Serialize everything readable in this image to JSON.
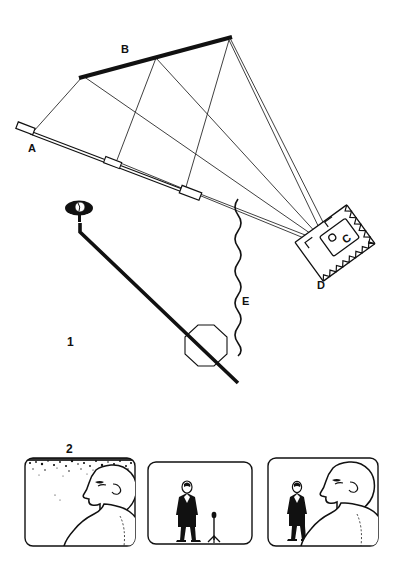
{
  "figure": {
    "type": "technical-line-diagram",
    "background_color": "#ffffff",
    "ink_color": "#111111",
    "width": 400,
    "height": 581
  },
  "figure1": {
    "number_label": "1",
    "caption_letters": {
      "a": "A",
      "b": "B",
      "c": "C",
      "d": "D",
      "e": "E"
    },
    "parts": [
      {
        "id": "A",
        "name": "lower-rail",
        "description": "thin double-line rail with end caps, inclined down-right"
      },
      {
        "id": "B",
        "name": "upper-bar",
        "description": "thick solid bar inclined up-right"
      },
      {
        "id": "C",
        "name": "lens-aperture",
        "description": "small circle and c-shape inside inner block of unit D"
      },
      {
        "id": "D",
        "name": "projector-unit",
        "description": "tilted rectangular housing with hatched border"
      },
      {
        "id": "E",
        "name": "wavy-signal-line",
        "description": "vertical wavy line"
      }
    ],
    "other_elements": [
      {
        "name": "eye-indicator",
        "description": "filled ellipse with white iris on a short post"
      },
      {
        "name": "pointer-arm",
        "description": "thick line from eye post down to lower right"
      },
      {
        "name": "octagon-target",
        "description": "outlined octagon crossed by the pointer arm"
      },
      {
        "name": "ray-lines",
        "description": "thin straight rays converging on unit D"
      }
    ]
  },
  "figure2": {
    "number_label": "2",
    "frames": [
      {
        "name": "frame-left",
        "content": "close-up profile of a person's head and shoulders with stippled/grainy background at top",
        "elements": [
          "head-profile-outline",
          "shoulder-outline",
          "stipple-texture"
        ]
      },
      {
        "name": "frame-middle",
        "content": "full-length silhouette of a person in a dark suit standing beside a microphone stand",
        "elements": [
          "standing-person-silhouette",
          "microphone-stand"
        ]
      },
      {
        "name": "frame-right",
        "content": "over-the-shoulder view: small standing person silhouette at left, large head-and-shoulders profile at right",
        "elements": [
          "standing-person-silhouette",
          "head-profile-outline",
          "shoulder-outline"
        ]
      }
    ]
  }
}
